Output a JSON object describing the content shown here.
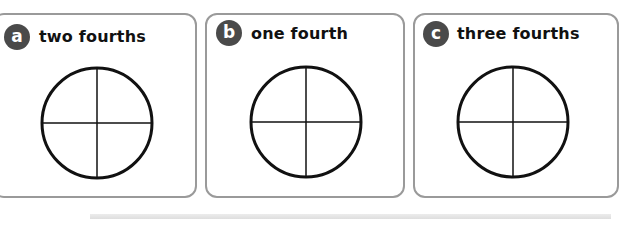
{
  "cards": [
    {
      "id": "a",
      "badge": "a",
      "label": "two fourths",
      "shape": "circle divided into 4 equal parts",
      "parts": 4,
      "shaded_parts": 0
    },
    {
      "id": "b",
      "badge": "b",
      "label": "one fourth",
      "shape": "circle divided into 4 equal parts",
      "parts": 4,
      "shaded_parts": 0
    },
    {
      "id": "c",
      "badge": "c",
      "label": "three fourths",
      "shape": "circle divided into 4 equal parts",
      "parts": 4,
      "shaded_parts": 0
    }
  ],
  "colors": {
    "card_border": "#9a9a9a",
    "badge_bg": "#4a4a4a",
    "badge_text": "#ffffff",
    "label_text": "#111111",
    "circle_stroke": "#111111"
  }
}
